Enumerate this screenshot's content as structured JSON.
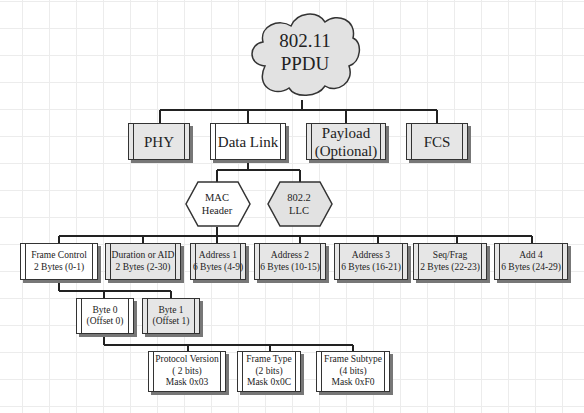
{
  "root": {
    "line1": "802.11",
    "line2": "PPDU"
  },
  "level1": [
    {
      "label": "PHY",
      "fill": "grey"
    },
    {
      "label": "Data Link",
      "fill": "white"
    },
    {
      "line1": "Payload",
      "line2": "(Optional)",
      "fill": "grey"
    },
    {
      "label": "FCS",
      "fill": "grey"
    }
  ],
  "data_link_children": [
    {
      "line1": "MAC",
      "line2": "Header",
      "fill": "white"
    },
    {
      "line1": "802.2",
      "line2": "LLC",
      "fill": "grey"
    }
  ],
  "mac_header_fields": [
    {
      "name": "Frame Control",
      "size": "2 Bytes (0-1)",
      "fill": "white"
    },
    {
      "name": "Duration or AID",
      "size": "2 Bytes  (2-30)",
      "fill": "grey"
    },
    {
      "name": "Address 1",
      "size": "6 Bytes (4-9)",
      "fill": "grey"
    },
    {
      "name": "Address 2",
      "size": "6 Bytes (10-15)",
      "fill": "grey"
    },
    {
      "name": "Address 3",
      "size": "6 Bytes (16-21)",
      "fill": "grey"
    },
    {
      "name": "Seq/Frag",
      "size": "2 Bytes (22-23)",
      "fill": "grey"
    },
    {
      "name": "Add 4",
      "size": "6 Bytes (24-29)",
      "fill": "grey"
    }
  ],
  "frame_control_bytes": [
    {
      "name": "Byte 0",
      "offset": "(Offset 0)",
      "fill": "white"
    },
    {
      "name": "Byte 1",
      "offset": "(Offset 1)",
      "fill": "grey"
    }
  ],
  "byte0_fields": [
    {
      "name": "Protocol Version",
      "bits": "( 2 bits)",
      "mask": "Mask 0x03"
    },
    {
      "name": "Frame Type",
      "bits": "(2 bits)",
      "mask": "Mask 0x0C"
    },
    {
      "name": "Frame Subtype",
      "bits": "(4 bits)",
      "mask": "Mask 0xF0"
    }
  ],
  "colors": {
    "grey_fill": "#e6e6e6",
    "white_fill": "#ffffff",
    "line": "#222222",
    "shadow": "#777777"
  }
}
